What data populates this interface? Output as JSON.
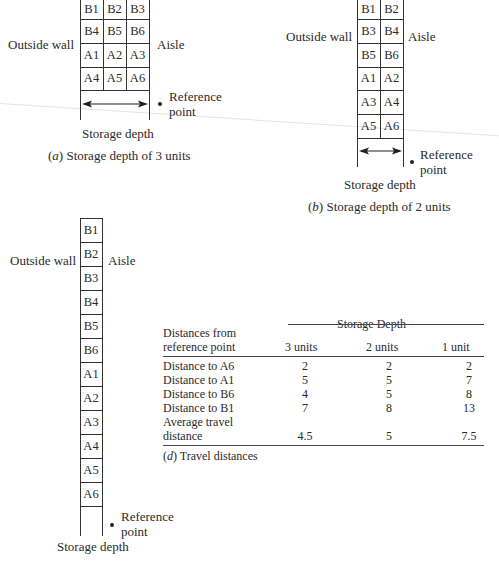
{
  "labels": {
    "outside_wall": "Outside wall",
    "aisle": "Aisle",
    "reference": "Reference",
    "point": "point",
    "storage_depth": "Storage depth"
  },
  "diagram_a": {
    "caption_letter": "a",
    "caption_text": " Storage depth of 3 units",
    "rows": [
      [
        "B1",
        "B2",
        "B3"
      ],
      [
        "B4",
        "B5",
        "B6"
      ],
      [
        "A1",
        "A2",
        "A3"
      ],
      [
        "A4",
        "A5",
        "A6"
      ]
    ]
  },
  "diagram_b": {
    "caption_letter": "b",
    "caption_text": " Storage depth of 2 units",
    "rows": [
      [
        "B1",
        "B2"
      ],
      [
        "B3",
        "B4"
      ],
      [
        "B5",
        "B6"
      ],
      [
        "A1",
        "A2"
      ],
      [
        "A3",
        "A4"
      ],
      [
        "A5",
        "A6"
      ]
    ]
  },
  "diagram_c": {
    "rows": [
      "B1",
      "B2",
      "B3",
      "B4",
      "B5",
      "B6",
      "A1",
      "A2",
      "A3",
      "A4",
      "A5",
      "A6"
    ]
  },
  "table_d": {
    "group_header": "Storage Depth",
    "row_header_line1": "Distances from",
    "row_header_line2": "reference point",
    "columns": [
      "3 units",
      "2 units",
      "1 unit"
    ],
    "rows": [
      {
        "label": "Distance to A6",
        "values": [
          "2",
          "2",
          "2"
        ]
      },
      {
        "label": "Distance to A1",
        "values": [
          "5",
          "5",
          "7"
        ]
      },
      {
        "label": "Distance to B6",
        "values": [
          "4",
          "5",
          "8"
        ]
      },
      {
        "label": "Distance to B1",
        "values": [
          "7",
          "8",
          "13"
        ]
      }
    ],
    "avg_label_line1": "Average travel",
    "avg_label_line2": "distance",
    "avg_values": [
      "4.5",
      "5",
      "7.5"
    ],
    "caption_letter": "d",
    "caption_text": " Travel distances"
  }
}
